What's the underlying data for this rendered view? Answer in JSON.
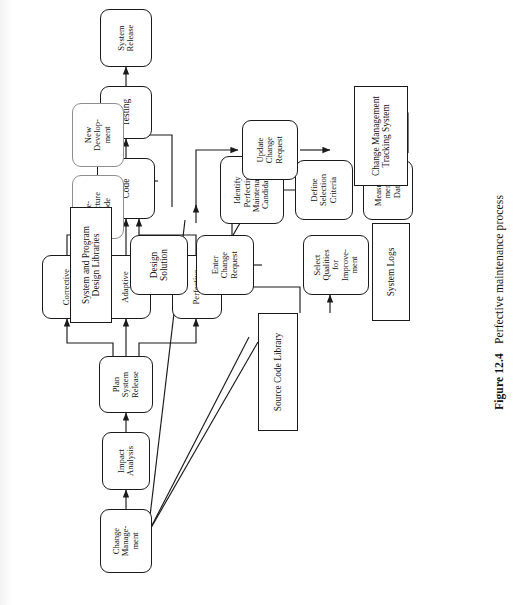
{
  "figure": {
    "number": "Figure 12.4",
    "caption": "Perfective maintenance process",
    "orientation": "rotated-90-ccw",
    "colors": {
      "ink": "#1a1a1a",
      "paper": "#ffffff",
      "optional_border": "#8e8e8e"
    }
  },
  "nodes": {
    "change_management": "Change\nManage-\nment",
    "impact_analysis": "Impact\nAnalysis",
    "plan_system_release": "Plan\nSystem\nRelease",
    "corrective": "Corrective",
    "adaptive": "Adaptive",
    "perfective": "Perfective",
    "code": "Code",
    "testing": "Testing",
    "system_release": "System\nRelease",
    "measurement_data": "Measure-\nment\nData",
    "define_selection_criteria": "Define\nSelection\nCriteria",
    "identify_perfective_candidates": "Identify\nPerfective\nMaintenance\nCandidates",
    "select_qualities": "Select\nQualities\nfor\nImprove-\nment",
    "enter_change_request": "Enter\nChange\nRequest",
    "design_solution": "Design\nSolution",
    "restructure_code": "Re-\nstructure\nCode",
    "new_development": "New\nDevelop-\nment",
    "update_change_request": "Update\nChange\nRequest",
    "change_mgmt_tracking_system": "Change Management\nTracking System",
    "system_logs": "System Logs",
    "source_code_library": "Source Code Library",
    "system_program_design_libraries": "System and Program\nDesign Libraries"
  },
  "flow_edges": [
    {
      "from": "change_management",
      "to": "impact_analysis"
    },
    {
      "from": "impact_analysis",
      "to": "plan_system_release"
    },
    {
      "from": "plan_system_release",
      "to": "corrective"
    },
    {
      "from": "plan_system_release",
      "to": "adaptive"
    },
    {
      "from": "plan_system_release",
      "to": "perfective"
    },
    {
      "from": "corrective",
      "to": "code"
    },
    {
      "from": "adaptive",
      "to": "code"
    },
    {
      "from": "perfective",
      "to": "code"
    },
    {
      "from": "code",
      "to": "testing"
    },
    {
      "from": "testing",
      "to": "system_release"
    },
    {
      "from": "change_management",
      "to": "measurement_data"
    },
    {
      "from": "change_management",
      "to": "source_code_library"
    },
    {
      "from": "change_management",
      "to": "design_solution"
    },
    {
      "from": "measurement_data",
      "to": "define_selection_criteria"
    },
    {
      "from": "system_logs",
      "to": "define_selection_criteria"
    },
    {
      "from": "define_selection_criteria",
      "to": "identify_perfective_candidates"
    },
    {
      "from": "identify_perfective_candidates",
      "to": "select_qualities"
    },
    {
      "from": "source_code_library",
      "to": "select_qualities"
    },
    {
      "from": "select_qualities",
      "to": "enter_change_request"
    },
    {
      "from": "enter_change_request",
      "to": "design_solution"
    },
    {
      "from": "source_code_library",
      "to": "design_solution"
    },
    {
      "from": "design_solution",
      "to": "system_program_design_libraries"
    },
    {
      "from": "design_solution",
      "to": "restructure_code"
    },
    {
      "from": "design_solution",
      "to": "new_development"
    },
    {
      "from": "design_solution",
      "to": "update_change_request"
    },
    {
      "from": "update_change_request",
      "to": "change_mgmt_tracking_system"
    },
    {
      "from": "enter_change_request",
      "to": "change_mgmt_tracking_system"
    },
    {
      "from": "define_selection_criteria",
      "to": "change_mgmt_tracking_system"
    },
    {
      "from": "perfective",
      "to": "source_code_library"
    }
  ]
}
